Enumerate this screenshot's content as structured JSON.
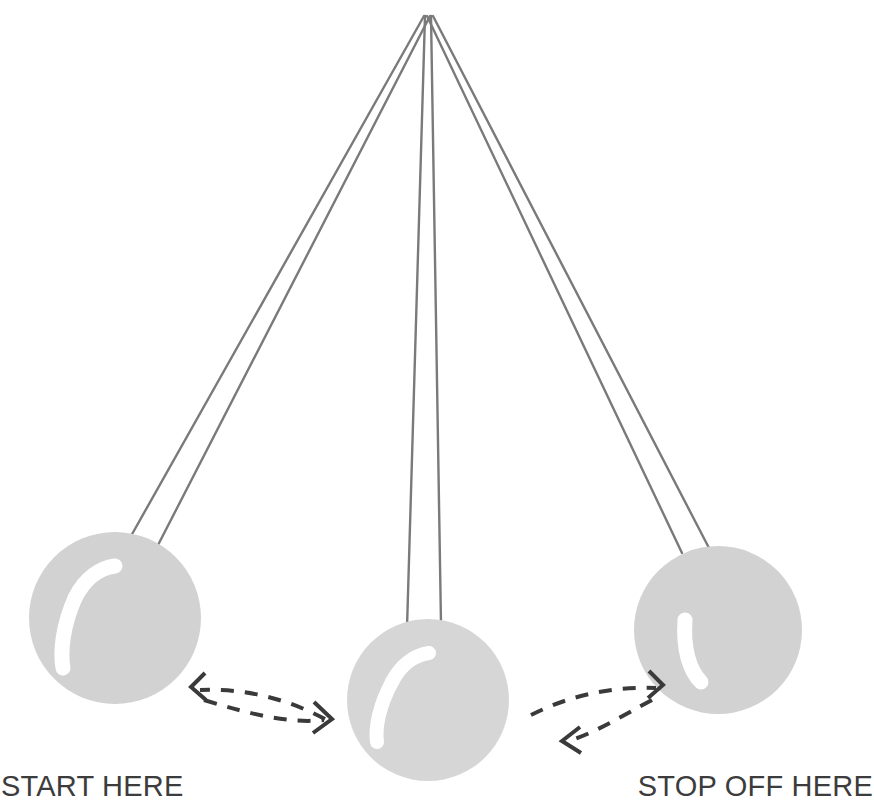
{
  "scene": {
    "title": "Pendulum swing diagram",
    "background_color": "#ffffff",
    "canvas": {
      "width": 874,
      "height": 803
    }
  },
  "pivot": {
    "x": 428,
    "y": 15
  },
  "colors": {
    "string": "#7a7a7a",
    "ball_fill": "#d2d2d2",
    "ball_fill_light": "#d6d6d6",
    "highlight": "#ffffff",
    "arrow": "#3a3a3a",
    "label_text": "#3c3c3c"
  },
  "balls": [
    {
      "name": "left-ball",
      "position": "start",
      "cx": 115,
      "cy": 618,
      "r": 86,
      "fill": "#d2d2d2",
      "highlight": {
        "type": "crescent",
        "orientation": "upper-left"
      },
      "strings": [
        {
          "x1": 424,
          "y1": 16,
          "x2": 131,
          "y2": 534
        },
        {
          "x1": 430,
          "y1": 16,
          "x2": 156,
          "y2": 545
        }
      ]
    },
    {
      "name": "middle-ball",
      "position": "bottom",
      "cx": 428,
      "cy": 700,
      "r": 81,
      "fill": "#d6d6d6",
      "highlight": {
        "type": "crescent",
        "orientation": "upper-left"
      },
      "strings": [
        {
          "x1": 425,
          "y1": 16,
          "x2": 408,
          "y2": 625
        },
        {
          "x1": 431,
          "y1": 16,
          "x2": 441,
          "y2": 621
        }
      ]
    },
    {
      "name": "right-ball",
      "position": "stop",
      "cx": 718,
      "cy": 630,
      "r": 84,
      "fill": "#d2d2d2",
      "highlight": {
        "type": "crescent",
        "orientation": "left"
      },
      "strings": [
        {
          "x1": 427,
          "y1": 16,
          "x2": 683,
          "y2": 551
        },
        {
          "x1": 433,
          "y1": 16,
          "x2": 708,
          "y2": 546
        }
      ]
    }
  ],
  "arrows": [
    {
      "name": "arrow-left-upper",
      "direction": "left",
      "style": "dashed-curve",
      "head_at": {
        "x": 193,
        "y": 686
      },
      "path": "M 324 718 C 290 700, 250 689, 197 690"
    },
    {
      "name": "arrow-left-lower",
      "direction": "right",
      "style": "dashed-curve",
      "head_at": {
        "x": 330,
        "y": 718
      },
      "path": "M 203 698 C 248 712, 288 722, 324 718"
    },
    {
      "name": "arrow-right-upper",
      "direction": "right",
      "style": "dashed-curve",
      "head_at": {
        "x": 663,
        "y": 684
      },
      "path": "M 533 716 C 568 698, 610 688, 659 689"
    },
    {
      "name": "arrow-right-lower",
      "direction": "left",
      "style": "dashed-curve",
      "head_at": {
        "x": 564,
        "y": 742
      },
      "path": "M 655 699 C 625 715, 600 730, 570 740"
    }
  ],
  "labels": {
    "start": "START HERE",
    "stop": "STOP OFF HERE"
  }
}
